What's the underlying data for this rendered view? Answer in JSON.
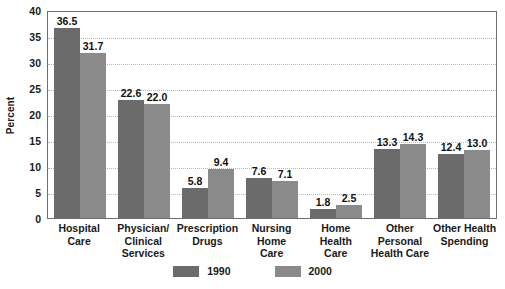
{
  "chart_data": {
    "type": "bar",
    "title": "",
    "xlabel": "",
    "ylabel": "Percent",
    "ylim": [
      0,
      40
    ],
    "ytick_step": 5,
    "yticks": [
      "40",
      "35",
      "30",
      "25",
      "20",
      "15",
      "10",
      "5",
      "0"
    ],
    "grid": true,
    "legend_position": "bottom-center",
    "categories": [
      "Hospital Care",
      "Physician/ Clinical Services",
      "Prescription Drugs",
      "Nursing Home Care",
      "Home Health Care",
      "Other Personal Health Care",
      "Other Health Spending"
    ],
    "category_lines": [
      [
        "Hospital",
        "Care"
      ],
      [
        "Physician/",
        "Clinical",
        "Services"
      ],
      [
        "Prescription",
        "Drugs"
      ],
      [
        "Nursing",
        "Home",
        "Care"
      ],
      [
        "Home",
        "Health",
        "Care"
      ],
      [
        "Other",
        "Personal",
        "Health Care"
      ],
      [
        "Other Health",
        "Spending"
      ]
    ],
    "series": [
      {
        "name": "1990",
        "color": "#6b6b6b",
        "values": [
          36.5,
          22.6,
          5.8,
          7.6,
          1.8,
          13.3,
          12.4
        ],
        "labels": [
          "36.5",
          "22.6",
          "5.8",
          "7.6",
          "1.8",
          "13.3",
          "12.4"
        ]
      },
      {
        "name": "2000",
        "color": "#8a8a8a",
        "values": [
          31.7,
          22.0,
          9.4,
          7.1,
          2.5,
          14.3,
          13.0
        ],
        "labels": [
          "31.7",
          "22.0",
          "9.4",
          "7.1",
          "2.5",
          "14.3",
          "13.0"
        ]
      }
    ]
  },
  "legend": {
    "items": [
      {
        "label": "1990",
        "color": "#6b6b6b"
      },
      {
        "label": "2000",
        "color": "#8a8a8a"
      }
    ]
  },
  "axis": {
    "y_title": "Percent"
  }
}
